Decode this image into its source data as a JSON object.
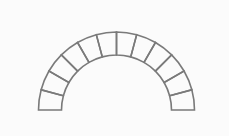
{
  "diagram": {
    "title": "",
    "background_color": "#fbfbfb",
    "stroke_color": "#7a7a7a",
    "stroke_width": 1.6,
    "center": {
      "x": 116.5,
      "y": 110
    },
    "outer_radius": 78,
    "inner_radius": 55,
    "voussoir_count": 12,
    "start_angle_deg": 180,
    "end_angle_deg": 0
  }
}
